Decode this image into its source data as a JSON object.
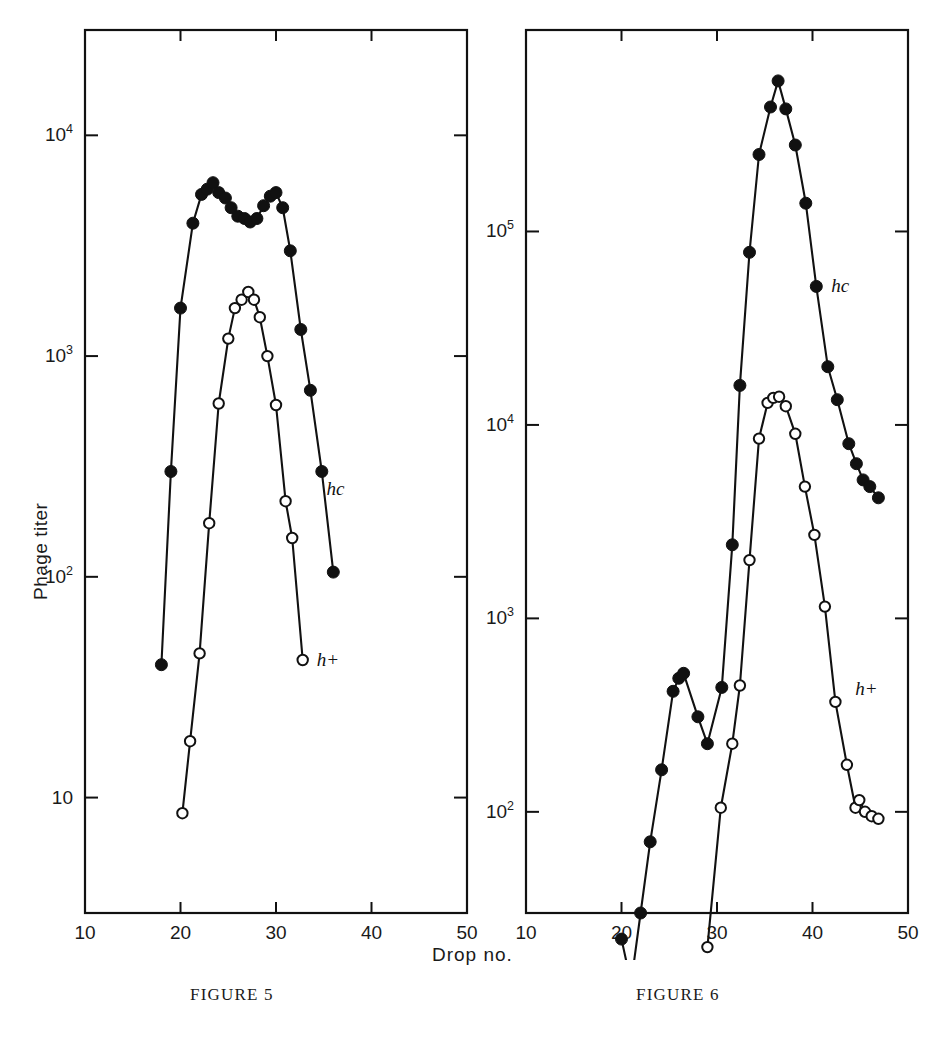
{
  "figure": {
    "axis_titles": {
      "y": "Phage titer",
      "x": "Drop no."
    },
    "captions": {
      "left": "FIGURE 5",
      "right": "FIGURE 6"
    }
  },
  "chart_data": [
    {
      "type": "scatter",
      "title": "Figure 5",
      "xlabel": "Drop no.",
      "ylabel": "Phage titer",
      "xlim": [
        10,
        50
      ],
      "ylim": [
        3,
        30000
      ],
      "yscale": "log",
      "xticks": [
        10,
        20,
        30,
        40,
        50
      ],
      "yticks": [
        10,
        100,
        1000,
        10000
      ],
      "ytick_labels": [
        "10",
        "10^2",
        "10^3",
        "10^4"
      ],
      "grid": false,
      "legend": "inline-annotations",
      "series": [
        {
          "name": "hc",
          "marker": "filled-circle",
          "label_x": 33.6,
          "label_y": 250,
          "points": [
            {
              "x": 18.0,
              "y": 40
            },
            {
              "x": 19.0,
              "y": 300
            },
            {
              "x": 20.0,
              "y": 1650
            },
            {
              "x": 21.3,
              "y": 4000
            },
            {
              "x": 22.2,
              "y": 5400
            },
            {
              "x": 22.8,
              "y": 5700
            },
            {
              "x": 23.4,
              "y": 6100
            },
            {
              "x": 24.0,
              "y": 5500
            },
            {
              "x": 24.7,
              "y": 5200
            },
            {
              "x": 25.3,
              "y": 4700
            },
            {
              "x": 26.0,
              "y": 4300
            },
            {
              "x": 26.7,
              "y": 4200
            },
            {
              "x": 27.3,
              "y": 4050
            },
            {
              "x": 28.0,
              "y": 4200
            },
            {
              "x": 28.7,
              "y": 4800
            },
            {
              "x": 29.4,
              "y": 5300
            },
            {
              "x": 30.0,
              "y": 5500
            },
            {
              "x": 30.7,
              "y": 4700
            },
            {
              "x": 31.5,
              "y": 3000
            },
            {
              "x": 32.6,
              "y": 1320
            },
            {
              "x": 33.6,
              "y": 700
            },
            {
              "x": 34.8,
              "y": 300
            },
            {
              "x": 36.0,
              "y": 105
            }
          ]
        },
        {
          "name": "h+",
          "marker": "open-circle",
          "label_x": 32.8,
          "label_y": 42,
          "points": [
            {
              "x": 20.2,
              "y": 8.5
            },
            {
              "x": 21.0,
              "y": 18
            },
            {
              "x": 22.0,
              "y": 45
            },
            {
              "x": 23.0,
              "y": 175
            },
            {
              "x": 24.0,
              "y": 610
            },
            {
              "x": 25.0,
              "y": 1200
            },
            {
              "x": 25.7,
              "y": 1650
            },
            {
              "x": 26.4,
              "y": 1800
            },
            {
              "x": 27.1,
              "y": 1950
            },
            {
              "x": 27.7,
              "y": 1800
            },
            {
              "x": 28.3,
              "y": 1500
            },
            {
              "x": 29.1,
              "y": 1000
            },
            {
              "x": 30.0,
              "y": 600
            },
            {
              "x": 31.0,
              "y": 220
            },
            {
              "x": 31.7,
              "y": 150
            },
            {
              "x": 32.8,
              "y": 42
            }
          ]
        }
      ]
    },
    {
      "type": "scatter",
      "title": "Figure 6",
      "xlabel": "Drop no.",
      "ylabel": "Phage titer",
      "xlim": [
        10,
        50
      ],
      "ylim": [
        30,
        1100000
      ],
      "yscale": "log",
      "xticks": [
        10,
        20,
        30,
        40,
        50
      ],
      "yticks": [
        100,
        1000,
        10000,
        100000
      ],
      "ytick_labels": [
        "10^2",
        "10^3",
        "10^4",
        "10^5"
      ],
      "grid": false,
      "legend": "inline-annotations",
      "series": [
        {
          "name": "hc",
          "marker": "filled-circle",
          "label_x": 40.3,
          "label_y": 52000,
          "points": [
            {
              "x": 20.0,
              "y": 22
            },
            {
              "x": 21.0,
              "y": 13
            },
            {
              "x": 22.0,
              "y": 30
            },
            {
              "x": 23.0,
              "y": 70
            },
            {
              "x": 24.2,
              "y": 165
            },
            {
              "x": 25.4,
              "y": 420
            },
            {
              "x": 26.0,
              "y": 490
            },
            {
              "x": 26.5,
              "y": 520
            },
            {
              "x": 28.0,
              "y": 310
            },
            {
              "x": 29.0,
              "y": 225
            },
            {
              "x": 30.5,
              "y": 440
            },
            {
              "x": 31.6,
              "y": 2400
            },
            {
              "x": 32.4,
              "y": 16000
            },
            {
              "x": 33.4,
              "y": 78000
            },
            {
              "x": 34.4,
              "y": 250000
            },
            {
              "x": 35.6,
              "y": 440000
            },
            {
              "x": 36.4,
              "y": 600000
            },
            {
              "x": 37.2,
              "y": 430000
            },
            {
              "x": 38.2,
              "y": 280000
            },
            {
              "x": 39.3,
              "y": 140000
            },
            {
              "x": 40.4,
              "y": 52000
            },
            {
              "x": 41.6,
              "y": 20000
            },
            {
              "x": 42.6,
              "y": 13500
            },
            {
              "x": 43.8,
              "y": 8000
            },
            {
              "x": 44.6,
              "y": 6300
            },
            {
              "x": 45.3,
              "y": 5200
            },
            {
              "x": 46.0,
              "y": 4800
            },
            {
              "x": 46.9,
              "y": 4200
            }
          ]
        },
        {
          "name": "h+",
          "marker": "open-circle",
          "label_x": 43.0,
          "label_y": 430,
          "points": [
            {
              "x": 29.0,
              "y": 20
            },
            {
              "x": 30.4,
              "y": 105
            },
            {
              "x": 31.6,
              "y": 225
            },
            {
              "x": 32.4,
              "y": 450
            },
            {
              "x": 33.4,
              "y": 2000
            },
            {
              "x": 34.4,
              "y": 8500
            },
            {
              "x": 35.3,
              "y": 13000
            },
            {
              "x": 35.9,
              "y": 13800
            },
            {
              "x": 36.5,
              "y": 14000
            },
            {
              "x": 37.2,
              "y": 12500
            },
            {
              "x": 38.2,
              "y": 9000
            },
            {
              "x": 39.2,
              "y": 4800
            },
            {
              "x": 40.2,
              "y": 2700
            },
            {
              "x": 41.3,
              "y": 1150
            },
            {
              "x": 42.4,
              "y": 370
            },
            {
              "x": 43.6,
              "y": 175
            },
            {
              "x": 44.5,
              "y": 105
            },
            {
              "x": 44.9,
              "y": 115
            },
            {
              "x": 45.5,
              "y": 100
            },
            {
              "x": 46.2,
              "y": 95
            },
            {
              "x": 46.9,
              "y": 92
            }
          ]
        }
      ]
    }
  ]
}
